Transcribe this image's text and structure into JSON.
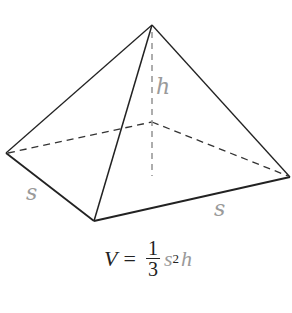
{
  "diagram": {
    "vertices": {
      "apex": [
        152,
        25
      ],
      "left": [
        6,
        153
      ],
      "front": [
        94,
        221
      ],
      "right": [
        290,
        177
      ],
      "back": [
        152,
        122
      ],
      "base_center": [
        152,
        175
      ]
    },
    "colors": {
      "edge": "#222222",
      "hidden": "#333333",
      "height": "#9a9a9a",
      "label": "#9a9a9a"
    },
    "labels": {
      "height": "h",
      "side_left": "s",
      "side_right": "s"
    },
    "formula": {
      "lhs": "V",
      "equals": "=",
      "numerator": "1",
      "denominator": "3",
      "base": "s",
      "exponent": "2",
      "height": "h"
    }
  }
}
